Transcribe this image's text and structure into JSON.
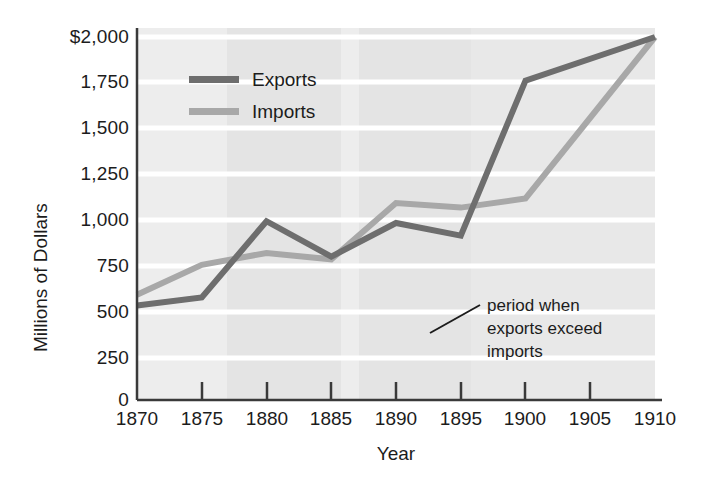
{
  "chart_data": {
    "type": "line",
    "title": "",
    "xlabel": "Year",
    "ylabel": "Millions of Dollars",
    "x": [
      1870,
      1875,
      1880,
      1885,
      1890,
      1895,
      1900,
      1910
    ],
    "xlim": [
      1870,
      1910
    ],
    "ylim": [
      0,
      2000
    ],
    "xticks": [
      "1870",
      "1875",
      "1880",
      "1885",
      "1890",
      "1895",
      "1900",
      "1905",
      "1910"
    ],
    "xtick_values": [
      1870,
      1875,
      1880,
      1885,
      1890,
      1895,
      1900,
      1905,
      1910
    ],
    "yticks": [
      "0",
      "250",
      "500",
      "750",
      "1,000",
      "1,250",
      "1,500",
      "1,750",
      "$2,000"
    ],
    "ytick_values": [
      0,
      250,
      500,
      750,
      1000,
      1250,
      1500,
      1750,
      2000
    ],
    "grid": true,
    "legend_position": "upper-left-inside",
    "series": [
      {
        "name": "Exports",
        "color": "#6e6e6e",
        "values": [
          520,
          565,
          985,
          790,
          975,
          905,
          1760,
          2000
        ]
      },
      {
        "name": "Imports",
        "color": "#a8a8a8",
        "values": [
          580,
          745,
          810,
          775,
          1085,
          1060,
          1110,
          2000
        ]
      }
    ],
    "annotations": [
      {
        "text": "period when\nexports exceed\nimports",
        "target_x": 1893,
        "target_y": 460
      }
    ],
    "shaded_bands": [
      {
        "from": 1877,
        "to": 1885
      },
      {
        "from": 1887,
        "to": 1896
      }
    ]
  },
  "axes": {
    "y_title": "Millions of Dollars",
    "x_title": "Year"
  },
  "legend": {
    "items": [
      {
        "label": "Exports",
        "color": "#6e6e6e"
      },
      {
        "label": "Imports",
        "color": "#a8a8a8"
      }
    ]
  },
  "annotation": {
    "line1": "period when",
    "line2": "exports exceed",
    "line3": "imports"
  },
  "colors": {
    "exports": "#6e6e6e",
    "imports": "#a8a8a8",
    "plot_background": "#eeeeee",
    "band_light": "#e6e6e6",
    "gridline": "#ffffff",
    "axis": "#3a3a3a",
    "text": "#1c1c1c"
  }
}
